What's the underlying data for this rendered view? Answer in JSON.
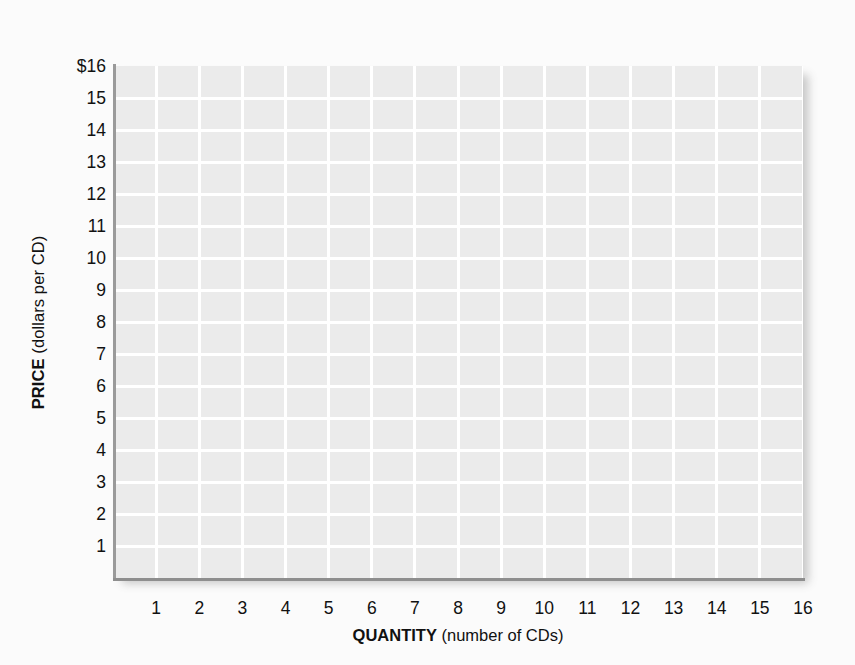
{
  "chart_data": {
    "type": "line",
    "title": "",
    "subtitle": "",
    "xlabel_bold": "QUANTITY",
    "xlabel_rest": " (number of CDs)",
    "ylabel_bold": "PRICE",
    "ylabel_rest": " (dollars per CD)",
    "xlabel": "QUANTITY (number of CDs)",
    "ylabel": "PRICE (dollars per CD)",
    "xlim": [
      0,
      16
    ],
    "ylim": [
      0,
      16
    ],
    "xticks": [
      1,
      2,
      3,
      4,
      5,
      6,
      7,
      8,
      9,
      10,
      11,
      12,
      13,
      14,
      15,
      16
    ],
    "yticks": [
      1,
      2,
      3,
      4,
      5,
      6,
      7,
      8,
      9,
      10,
      11,
      12,
      13,
      14,
      15,
      16
    ],
    "xtick_labels": [
      "1",
      "2",
      "3",
      "4",
      "5",
      "6",
      "7",
      "8",
      "9",
      "10",
      "11",
      "12",
      "13",
      "14",
      "15",
      "16"
    ],
    "ytick_labels": [
      "1",
      "2",
      "3",
      "4",
      "5",
      "6",
      "7",
      "8",
      "9",
      "10",
      "11",
      "12",
      "13",
      "14",
      "15",
      "$16"
    ],
    "grid": true,
    "grid_color": "#ffffff",
    "plot_background": "#ebebeb",
    "page_background": "#fbfbfb",
    "axis_color": "#9a9a9a",
    "legend": [],
    "legend_position": "none",
    "series": [],
    "annotations": [],
    "note": "Empty grid worksheet — no data series plotted."
  },
  "figure": {
    "name": "empty-price-quantity-grid"
  }
}
